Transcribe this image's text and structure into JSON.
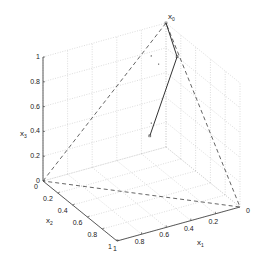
{
  "chart_data": {
    "type": "line3d",
    "title": "",
    "axes": {
      "x1": {
        "label": "x",
        "subscript": "1",
        "ticks": [
          0.2,
          0.4,
          0.6,
          0.8,
          1
        ],
        "tick_labels": [
          "0.2",
          "0.4",
          "0.6",
          "0.8",
          "1"
        ],
        "range": [
          0,
          1
        ]
      },
      "x2": {
        "label": "x",
        "subscript": "2",
        "ticks": [
          0,
          0.2,
          0.4,
          0.6,
          0.8,
          1
        ],
        "tick_labels": [
          "0",
          "0.2",
          "0.4",
          "0.6",
          "0.8",
          "1"
        ],
        "range": [
          0,
          1
        ]
      },
      "x3": {
        "label": "x",
        "subscript": "3",
        "ticks": [
          0,
          0.2,
          0.4,
          0.6,
          0.8,
          1
        ],
        "tick_labels": [
          "0",
          "0.2",
          "0.4",
          "0.6",
          "0.8",
          "1"
        ],
        "range": [
          0,
          1
        ]
      }
    },
    "x1_origin_label": "0",
    "grid": true,
    "series": [
      {
        "name": "simplex",
        "style": "dashed",
        "points": [
          [
            1,
            0,
            0
          ],
          [
            0,
            0,
            1
          ],
          [
            0,
            1,
            0
          ],
          [
            1,
            0,
            0
          ]
        ]
      },
      {
        "name": "trajectory",
        "style": "solid",
        "points": [
          [
            0,
            0,
            1
          ],
          [
            0,
            0.15,
            0.8
          ],
          [
            0.33,
            0.33,
            0.34
          ]
        ]
      },
      {
        "name": "scattered-points",
        "style": "dots",
        "points": [
          [
            0.15,
            0.05,
            0.8
          ],
          [
            0.12,
            0.1,
            0.75
          ],
          [
            0.3,
            0.3,
            0.42
          ]
        ]
      }
    ],
    "annotations": [
      {
        "text": "x",
        "subscript": "0",
        "at": [
          0,
          0,
          1
        ]
      }
    ]
  }
}
